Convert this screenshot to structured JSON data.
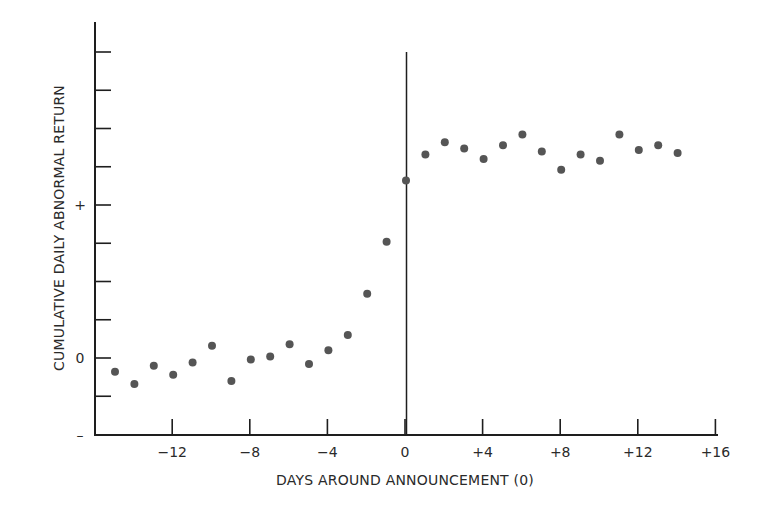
{
  "chart_data": {
    "type": "scatter",
    "title": "",
    "xlabel": "DAYS AROUND ANNOUNCEMENT (0)",
    "ylabel": "CUMULATIVE DAILY ABNORMAL RETURN",
    "x_ticks": [
      -12,
      -8,
      -4,
      0,
      4,
      8,
      12,
      16
    ],
    "x_tick_labels": [
      "−12",
      "−8",
      "−4",
      "0",
      "+4",
      "+8",
      "+12",
      "+16"
    ],
    "xlim": [
      -16.5,
      16
    ],
    "y_tick_labels": [
      {
        "value": 1,
        "label": "+"
      },
      {
        "value": 0,
        "label": "0"
      },
      {
        "value": -0.5,
        "label": "–"
      }
    ],
    "y_minor_ticks": [
      -0.25,
      0.25,
      0.5,
      0.75,
      1.0,
      1.25,
      1.5,
      1.75,
      2.0
    ],
    "ylim": [
      -0.5,
      2.2
    ],
    "vertical_reference_line": {
      "x": 0
    },
    "grid": false,
    "legend": null,
    "series": [
      {
        "name": "Cumulative daily abnormal return",
        "marker_color": "#555555",
        "points": [
          {
            "x": -15,
            "y": -0.09
          },
          {
            "x": -14,
            "y": -0.17
          },
          {
            "x": -13,
            "y": -0.05
          },
          {
            "x": -12,
            "y": -0.11
          },
          {
            "x": -11,
            "y": -0.03
          },
          {
            "x": -10,
            "y": 0.08
          },
          {
            "x": -9,
            "y": -0.15
          },
          {
            "x": -8,
            "y": -0.01
          },
          {
            "x": -7,
            "y": 0.01
          },
          {
            "x": -6,
            "y": 0.09
          },
          {
            "x": -5,
            "y": -0.04
          },
          {
            "x": -4,
            "y": 0.05
          },
          {
            "x": -3,
            "y": 0.15
          },
          {
            "x": -2,
            "y": 0.42
          },
          {
            "x": -1,
            "y": 0.76
          },
          {
            "x": 0,
            "y": 1.16
          },
          {
            "x": 1,
            "y": 1.33
          },
          {
            "x": 2,
            "y": 1.41
          },
          {
            "x": 3,
            "y": 1.37
          },
          {
            "x": 4,
            "y": 1.3
          },
          {
            "x": 5,
            "y": 1.39
          },
          {
            "x": 6,
            "y": 1.46
          },
          {
            "x": 7,
            "y": 1.35
          },
          {
            "x": 8,
            "y": 1.23
          },
          {
            "x": 9,
            "y": 1.33
          },
          {
            "x": 10,
            "y": 1.29
          },
          {
            "x": 11,
            "y": 1.46
          },
          {
            "x": 12,
            "y": 1.36
          },
          {
            "x": 13,
            "y": 1.39
          },
          {
            "x": 14,
            "y": 1.34
          }
        ]
      }
    ]
  },
  "colors": {
    "axis": "#1e1e1e",
    "marker": "#555555",
    "text": "#2a2a2a",
    "background": "#ffffff"
  }
}
